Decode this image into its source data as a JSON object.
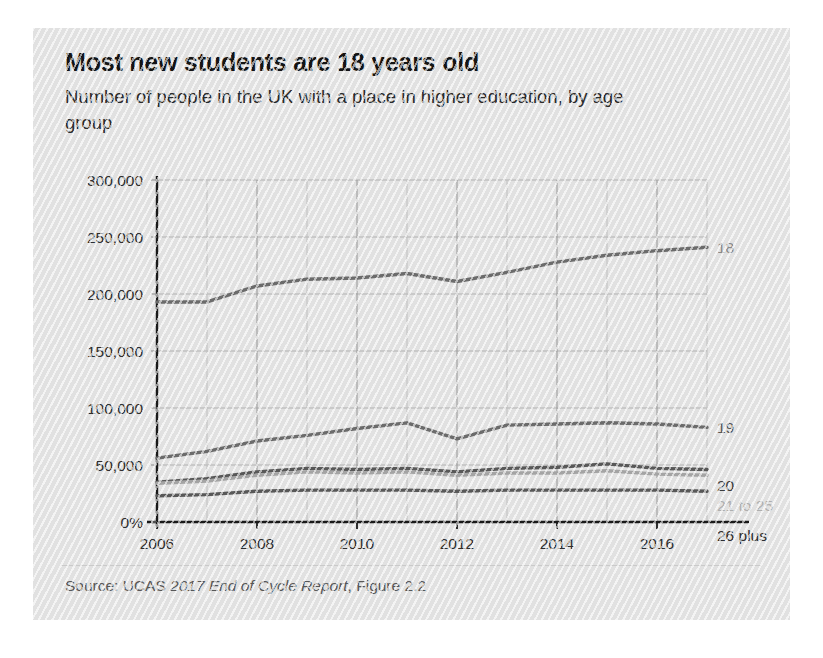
{
  "figure": {
    "title": "Most new students are 18 years old",
    "subtitle": "Number of people in the UK with a place in higher education, by age group",
    "source_prefix": "Source: UCAS ",
    "source_italic": "2017 End of Cycle Report",
    "source_suffix": ", Figure 2.2",
    "panel_color": "#e6e6e6"
  },
  "chart_data": {
    "type": "line",
    "title": "Most new students are 18 years old",
    "subtitle": "Number of people in the UK with a place in higher education, by age group",
    "xlabel": "",
    "ylabel": "",
    "grid": true,
    "legend_position": "right-inline-labels",
    "x": [
      2006,
      2007,
      2008,
      2009,
      2010,
      2011,
      2012,
      2013,
      2014,
      2015,
      2016,
      2017
    ],
    "xtick_labels": [
      "2006",
      "2008",
      "2010",
      "2012",
      "2014",
      "2016"
    ],
    "xtick_values": [
      2006,
      2008,
      2010,
      2012,
      2014,
      2016
    ],
    "xlim": [
      2006,
      2017
    ],
    "ytick_labels": [
      "0%",
      "50,000",
      "100,000",
      "150,000",
      "200,000",
      "250,000",
      "300,000"
    ],
    "ytick_values": [
      0,
      50000,
      100000,
      150000,
      200000,
      250000,
      300000
    ],
    "ylim": [
      0,
      300000
    ],
    "series": [
      {
        "name": "18",
        "color": "#6e6e6e",
        "label_color": "#8c8c8c",
        "values": [
          193000,
          193000,
          207000,
          213000,
          214000,
          218000,
          211000,
          219000,
          228000,
          234000,
          238000,
          241000
        ]
      },
      {
        "name": "19",
        "color": "#6e6e6e",
        "label_color": "#5a5a5a",
        "values": [
          56000,
          62000,
          71000,
          76000,
          82000,
          87000,
          73000,
          85000,
          86000,
          87000,
          86000,
          83000
        ]
      },
      {
        "name": "20",
        "color": "#5a5a5a",
        "label_color": "#3d3d3d",
        "values": [
          35000,
          38000,
          44000,
          47000,
          46000,
          47000,
          44000,
          47000,
          48000,
          51000,
          47000,
          46000
        ]
      },
      {
        "name": "21 to 25",
        "color": "#a8a8a8",
        "label_color": "#b3b3b3",
        "values": [
          34000,
          36000,
          41000,
          44000,
          43000,
          44000,
          41000,
          43000,
          43000,
          45000,
          42000,
          41000
        ]
      },
      {
        "name": "26 plus",
        "color": "#5a5a5a",
        "label_color": "#2f2f2f",
        "values": [
          23000,
          24000,
          27000,
          28000,
          28000,
          28000,
          27000,
          28000,
          28000,
          28000,
          28000,
          27000
        ]
      }
    ]
  }
}
